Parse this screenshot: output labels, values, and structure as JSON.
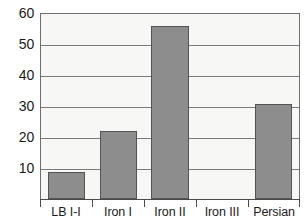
{
  "chart_data": {
    "type": "bar",
    "title": "",
    "subtitle": "",
    "xlabel": "",
    "ylabel": "",
    "categories": [
      "LB I-I",
      "Iron I",
      "Iron II",
      "Iron III",
      "Persian"
    ],
    "values": [
      8.7,
      22.2,
      56.2,
      0,
      30.7
    ],
    "ylim": [
      0,
      60
    ],
    "yticks": [
      10,
      20,
      30,
      40,
      50,
      60
    ],
    "ytick_labels": [
      "10",
      "20",
      "30",
      "40",
      "50",
      "60"
    ],
    "grid": "horizontal",
    "legend": "none",
    "series": [
      {
        "name": "",
        "values": [
          8.7,
          22.2,
          56.2,
          0,
          30.7
        ]
      }
    ],
    "annotations": [],
    "colors": {
      "bar_fill": "#8d8d8d",
      "bar_border": "#545454",
      "plot_background": "#f7f7f5",
      "plot_border": "#6d6d6d",
      "gridline": "#7a7a7a",
      "axis": "#4a4a4a",
      "text": "#1a1a1a"
    }
  }
}
